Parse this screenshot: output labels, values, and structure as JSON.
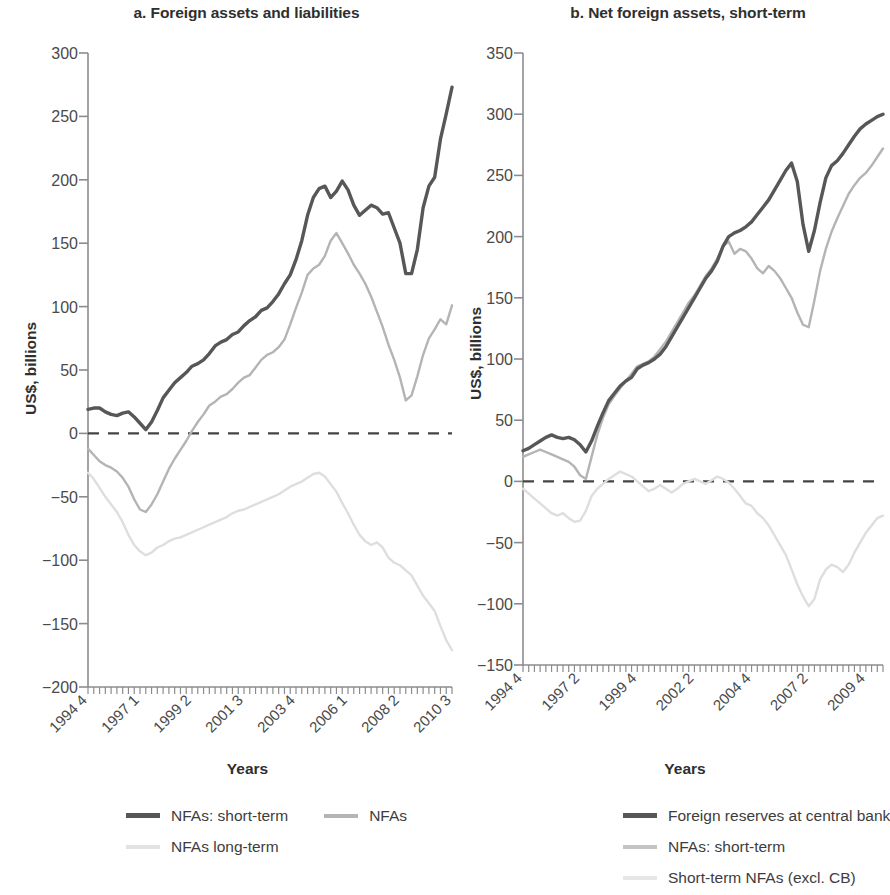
{
  "figure": {
    "panels": [
      {
        "id": "panel-a",
        "title": "a. Foreign assets and liabilities",
        "ylabel": "US$, billions",
        "xlabel": "Years"
      },
      {
        "id": "panel-b",
        "title": "b. Net foreign assets, short-term",
        "ylabel": "US$, billions",
        "xlabel": "Years"
      }
    ],
    "legend_a": [
      {
        "label": "NFAs: short-term",
        "color": "#575757"
      },
      {
        "label": "NFAs",
        "color": "#b4b4b4"
      },
      {
        "label": "NFAs long-term",
        "color": "#dedede"
      }
    ],
    "legend_b": [
      {
        "label": "Foreign reserves at central bank",
        "color": "#575757"
      },
      {
        "label": "NFAs: short-term",
        "color": "#b4b4b4"
      },
      {
        "label": "Short-term NFAs (excl. CB)",
        "color": "#dedede"
      }
    ]
  },
  "chart_data": [
    {
      "type": "line",
      "id": "panel-a",
      "title": "a. Foreign assets and liabilities",
      "xlabel": "Years",
      "ylabel": "US$, billions",
      "ylim": [
        -200,
        300
      ],
      "yticks": [
        300,
        250,
        200,
        150,
        100,
        50,
        0,
        -50,
        -100,
        -150,
        -200
      ],
      "ytick_labels": [
        "300",
        "250",
        "200",
        "150",
        "100",
        "50",
        "0",
        "−50",
        "−100",
        "−150",
        "−200"
      ],
      "grid": false,
      "zero_line": true,
      "x_start": "1994 Q4",
      "x_end": "2010 Q3",
      "xticks": [
        "1994 4",
        "1997 1",
        "1999 2",
        "2001 3",
        "2003 4",
        "2006 1",
        "2008 2",
        "2010 3"
      ],
      "xtick_positions": [
        0,
        9,
        18,
        27,
        36,
        45,
        54,
        63
      ],
      "n_points": 64,
      "series": [
        {
          "name": "NFAs: short-term",
          "color": "#575757",
          "width": 3.4,
          "values": [
            19,
            20,
            20,
            17,
            15,
            14,
            16,
            17,
            13,
            8,
            3,
            9,
            18,
            28,
            34,
            40,
            44,
            48,
            53,
            55,
            58,
            63,
            69,
            72,
            74,
            78,
            80,
            85,
            89,
            92,
            97,
            99,
            104,
            110,
            118,
            125,
            137,
            152,
            172,
            186,
            193,
            195,
            186,
            191,
            199,
            192,
            180,
            172,
            176,
            180,
            178,
            173,
            174,
            162,
            150,
            126,
            126,
            145,
            178,
            195,
            202,
            232,
            252,
            273
          ]
        },
        {
          "name": "NFAs",
          "color": "#b4b4b4",
          "width": 2.4,
          "values": [
            -12,
            -17,
            -22,
            -25,
            -27,
            -30,
            -35,
            -42,
            -52,
            -60,
            -62,
            -56,
            -48,
            -38,
            -28,
            -20,
            -13,
            -6,
            2,
            9,
            15,
            22,
            25,
            29,
            31,
            35,
            40,
            44,
            46,
            52,
            58,
            62,
            64,
            68,
            74,
            86,
            99,
            111,
            125,
            130,
            133,
            140,
            152,
            158,
            150,
            142,
            133,
            126,
            118,
            108,
            96,
            84,
            70,
            58,
            44,
            26,
            30,
            45,
            62,
            75,
            82,
            90,
            86,
            101
          ]
        },
        {
          "name": "NFAs long-term",
          "color": "#dedede",
          "width": 2.4,
          "values": [
            -31,
            -36,
            -43,
            -50,
            -56,
            -62,
            -70,
            -80,
            -88,
            -93,
            -96,
            -94,
            -90,
            -88,
            -85,
            -83,
            -82,
            -80,
            -78,
            -76,
            -74,
            -72,
            -70,
            -68,
            -66,
            -63,
            -61,
            -60,
            -58,
            -56,
            -54,
            -52,
            -50,
            -48,
            -45,
            -42,
            -40,
            -38,
            -35,
            -32,
            -31,
            -34,
            -40,
            -46,
            -55,
            -63,
            -72,
            -80,
            -85,
            -88,
            -86,
            -90,
            -98,
            -102,
            -104,
            -108,
            -112,
            -120,
            -128,
            -134,
            -140,
            -152,
            -163,
            -171
          ]
        }
      ]
    },
    {
      "type": "line",
      "id": "panel-b",
      "title": "b. Net foreign assets, short-term",
      "xlabel": "Years",
      "ylabel": "US$, billions",
      "ylim": [
        -150,
        350
      ],
      "yticks": [
        350,
        300,
        250,
        200,
        150,
        100,
        50,
        0,
        -50,
        -100,
        -150
      ],
      "ytick_labels": [
        "350",
        "300",
        "250",
        "200",
        "150",
        "100",
        "50",
        "0",
        "−50",
        "−100",
        "−150"
      ],
      "grid": false,
      "zero_line": true,
      "x_start": "1994 Q4",
      "x_end": "2010 Q3",
      "xticks": [
        "1994 4",
        "1997 2",
        "1999 4",
        "2002 2",
        "2004 4",
        "2007 2",
        "2009 4"
      ],
      "xtick_positions": [
        0,
        10,
        20,
        30,
        40,
        50,
        60
      ],
      "n_points": 64,
      "series": [
        {
          "name": "Foreign reserves at central bank",
          "color": "#575757",
          "width": 3.4,
          "values": [
            25,
            27,
            30,
            33,
            36,
            38,
            36,
            35,
            36,
            34,
            30,
            24,
            33,
            45,
            56,
            66,
            72,
            78,
            82,
            85,
            92,
            95,
            97,
            100,
            104,
            110,
            118,
            126,
            134,
            142,
            150,
            158,
            166,
            172,
            180,
            192,
            200,
            203,
            205,
            208,
            212,
            218,
            224,
            230,
            238,
            246,
            254,
            260,
            245,
            210,
            188,
            205,
            228,
            248,
            258,
            262,
            268,
            275,
            282,
            288,
            292,
            295,
            298,
            300
          ]
        },
        {
          "name": "NFAs: short-term",
          "color": "#b4b4b4",
          "width": 2.4,
          "values": [
            20,
            22,
            24,
            26,
            24,
            22,
            20,
            18,
            16,
            12,
            5,
            2,
            20,
            38,
            52,
            63,
            70,
            76,
            82,
            88,
            94,
            96,
            98,
            102,
            108,
            114,
            122,
            130,
            138,
            146,
            152,
            160,
            168,
            174,
            182,
            192,
            196,
            186,
            190,
            188,
            182,
            174,
            170,
            176,
            172,
            166,
            158,
            150,
            138,
            128,
            126,
            148,
            172,
            190,
            204,
            215,
            225,
            235,
            242,
            248,
            252,
            258,
            265,
            272
          ]
        },
        {
          "name": "Short-term NFAs (excl. CB)",
          "color": "#dedede",
          "width": 2.4,
          "values": [
            -6,
            -10,
            -14,
            -18,
            -22,
            -26,
            -28,
            -26,
            -30,
            -33,
            -32,
            -24,
            -12,
            -6,
            -2,
            2,
            5,
            8,
            6,
            4,
            0,
            -4,
            -8,
            -6,
            -3,
            -6,
            -9,
            -6,
            -2,
            0,
            2,
            0,
            -2,
            1,
            4,
            2,
            -1,
            -6,
            -12,
            -18,
            -20,
            -26,
            -30,
            -36,
            -44,
            -52,
            -60,
            -72,
            -84,
            -94,
            -102,
            -96,
            -80,
            -72,
            -68,
            -70,
            -74,
            -68,
            -58,
            -50,
            -42,
            -36,
            -30,
            -28
          ]
        }
      ]
    }
  ]
}
